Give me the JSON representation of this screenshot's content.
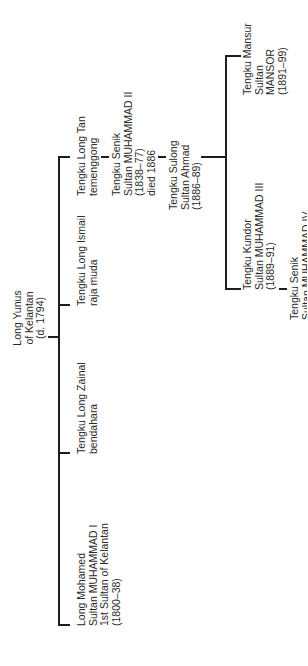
{
  "diagram": {
    "type": "genealogy",
    "orientation": "rotated-90-ccw",
    "root": {
      "lines": [
        "Long Yunus",
        "of Kelantan",
        "(d. 1794)"
      ]
    },
    "children": [
      {
        "lines": [
          "Tengku Long Tan",
          "temenggong"
        ]
      },
      {
        "lines": [
          "Tengku Long Ismail",
          "raja muda"
        ]
      },
      {
        "lines": [
          "Tengku Long Zainal",
          "bendahara"
        ]
      },
      {
        "lines": [
          "Long Mohamed",
          "Sultan MUHAMMAD I",
          "1st Sultan of Kelantan",
          "(1800–38)"
        ]
      }
    ],
    "long_tan_line": [
      {
        "lines": [
          "Tengku Senik",
          "Sultan MUHAMMAD II",
          "(1838–77)",
          "died 1886"
        ]
      },
      {
        "lines": [
          "Tengku Sulong",
          "Sultan Ahmad",
          "(1886–89)"
        ]
      }
    ],
    "sulong_children": [
      {
        "lines": [
          "Tengku Mansur",
          "Sultan",
          "MANSOR",
          "(1891–99)"
        ]
      },
      {
        "lines": [
          "Tengku Kundor",
          "Sultan MUHAMMAD III",
          "(1889–91)"
        ]
      }
    ],
    "kundor_child": {
      "lines": [
        "Tengku Senik",
        "Sultan MUHAMMAD IV"
      ]
    }
  }
}
